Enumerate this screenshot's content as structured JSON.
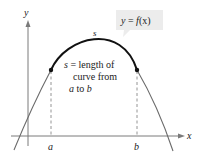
{
  "diagram": {
    "title_box": {
      "text_y": "y",
      "text_eq": " = ",
      "text_f": "f",
      "text_x": "(x)"
    },
    "axes": {
      "x_label": "x",
      "y_label": "y"
    },
    "curve_label": "s",
    "points": {
      "a_label": "a",
      "b_label": "b"
    },
    "annotation": {
      "line1_var": "s",
      "line1_rest": " = length of",
      "line2": "curve from",
      "line3_a": "a",
      "line3_mid": " to ",
      "line3_b": "b"
    },
    "colors": {
      "axis": "#7a7a7a",
      "curve_thin": "#6b6b6b",
      "curve_thick": "#111111",
      "box_fill": "#ececec",
      "text": "#222222"
    }
  }
}
